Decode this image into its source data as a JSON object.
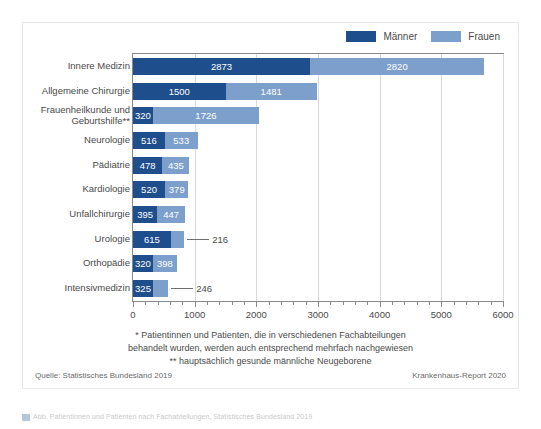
{
  "chart_data": {
    "type": "bar",
    "orientation": "horizontal",
    "stacked": true,
    "title": "",
    "xlabel": "",
    "ylabel": "",
    "xlim": [
      0,
      6000
    ],
    "xticks": [
      0,
      1000,
      2000,
      3000,
      4000,
      5000,
      6000
    ],
    "xtick_labels": [
      "0",
      "1000",
      "2000",
      "3000",
      "4000",
      "5000",
      "6000"
    ],
    "minor_tick_step": 200,
    "grid": true,
    "legend_position": "top-right",
    "categories": [
      "Innere Medizin",
      "Allgemeine Chirurgie",
      "Frauenheilkunde und Geburtshilfe**",
      "Neurologie",
      "Pädiatrie",
      "Kardiologie",
      "Unfallchirurgie",
      "Urologie",
      "Orthopädie",
      "Intensivmedizin"
    ],
    "category_lines": [
      [
        "Innere Medizin"
      ],
      [
        "Allgemeine Chirurgie"
      ],
      [
        "Frauenheilkunde und",
        "Geburtshilfe**"
      ],
      [
        "Neurologie"
      ],
      [
        "Pädiatrie"
      ],
      [
        "Kardiologie"
      ],
      [
        "Unfallchirurgie"
      ],
      [
        "Urologie"
      ],
      [
        "Orthopädie"
      ],
      [
        "Intensivmedizin"
      ]
    ],
    "series": [
      {
        "name": "Männer",
        "color": "#1f4e8c",
        "values": [
          2873,
          1500,
          320,
          516,
          478,
          520,
          395,
          615,
          320,
          325
        ]
      },
      {
        "name": "Frauen",
        "color": "#7d9fcb",
        "values": [
          2820,
          1481,
          1726,
          533,
          435,
          379,
          447,
          216,
          398,
          246
        ]
      }
    ],
    "label_placement": [
      {
        "series": "Männer",
        "category": "Urologie",
        "inside": true
      },
      {
        "series": "Frauen",
        "category": "Urologie",
        "inside": false
      },
      {
        "series": "Frauen",
        "category": "Intensivmedizin",
        "inside": false
      }
    ]
  },
  "legend": {
    "entries": [
      {
        "label": "Männer",
        "color": "#1f4e8c"
      },
      {
        "label": "Frauen",
        "color": "#7d9fcb"
      }
    ]
  },
  "footnotes": {
    "line1": "* Patientinnen und Patienten, die in verschiedenen Fachabteilungen",
    "line2": "behandelt wurden, werden auch entsprechend mehrfach nachgewiesen",
    "line3": "** hauptsächlich gesunde männliche Neugeborene"
  },
  "source": {
    "left": "Quelle: Statistisches Bundesland 2019",
    "right": "Krankenhaus-Report 2020"
  },
  "caption": {
    "text": "Abb. Patientinnen und Patienten nach Fachabteilungen, Statistisches Bundesland 2019"
  },
  "colors": {
    "maenner": "#1f4e8c",
    "frauen": "#7d9fcb",
    "axis": "#8a8a8a",
    "grid": "#d9d9d9",
    "text": "#4a4a4a"
  }
}
